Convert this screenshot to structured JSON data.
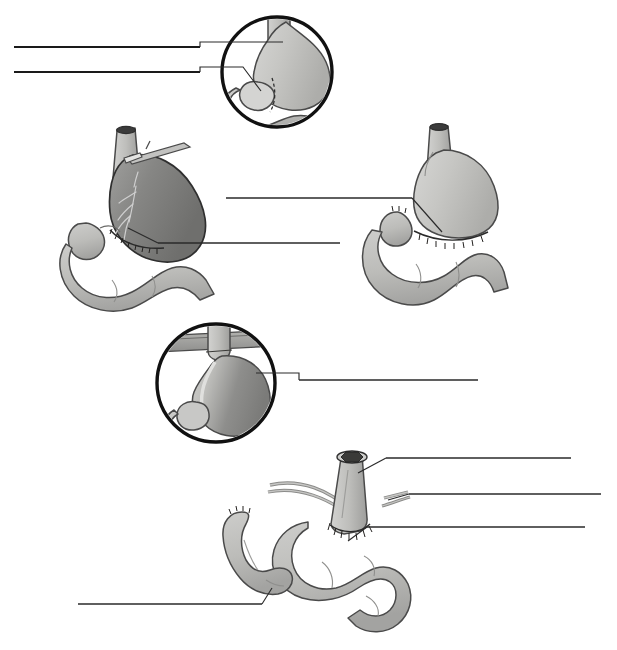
{
  "document": {
    "title": "Gastrectomy and Reconstruction Plate",
    "subject": "Total / subtotal gastrectomy with Billroth II and Roux-en-Y esophagojejunostomy reconstruction",
    "background_color": "#ffffff",
    "width": 617,
    "height": 650,
    "labels_present": false,
    "note": "All leader lines terminate in blank label areas; no label text is rendered in the image."
  },
  "palette": {
    "page_background": "#ffffff",
    "leader_line_dark": "#1a1a1a",
    "leader_line_thin": "#2a2a2a",
    "inset_ring": "#111111",
    "organ_fill_light": "#c9c9c7",
    "organ_fill_mid": "#b9b9b6",
    "organ_fill_shadow": "#a2a2a0",
    "organ_fill_dark": "#8a8a88",
    "organ_fill_darker": "#777775",
    "organ_outline": "#4a4a4a",
    "organ_outline_dark": "#2f2f2f",
    "lumen_dark": "#3b3b3b",
    "vessel_highlight": "#cfcfcf",
    "suture_stroke": "#23211f",
    "instrument_fill": "#bdbdbb"
  },
  "panels": [
    {
      "id": "panel-a",
      "name": "inset-stomach-resection-margins",
      "type": "circular-inset",
      "position": "top-center",
      "center": {
        "x": 277,
        "y": 72
      },
      "radius": 55,
      "description": "Circular magnified inset showing the stomach with esophagus above, duodenal bulb and proximal duodenum below, and a dashed resection line across the antrum.",
      "leader_lines": 2
    },
    {
      "id": "panel-b",
      "name": "stomach-with-clamp-and-vasculature",
      "type": "organ-figure",
      "position": "middle-left",
      "description": "Resected stomach specimen held by a surgical clamp on the proximal cardia, showing gastric vasculature, a sutured distal transection margin, and attached duodenum and jejunal loop.",
      "leader_lines": 1
    },
    {
      "id": "panel-c",
      "name": "billroth-two-gastrojejunostomy",
      "type": "organ-figure",
      "position": "middle-right",
      "description": "Completed gastrojejunal anastomosis: gastric remnant sutured to a jejunal loop with a blind afferent limb; esophagus stump above.",
      "leader_lines": 1
    },
    {
      "id": "panel-d",
      "name": "inset-stomach-through-diaphragm",
      "type": "circular-inset",
      "position": "lower-center-left",
      "center": {
        "x": 216,
        "y": 383
      },
      "radius": 59,
      "description": "Circular magnified inset showing the stomach passing through the diaphragmatic hiatus, with dark shading of the gastric body and lighter lesser-curvature highlight.",
      "leader_lines": 1
    },
    {
      "id": "panel-e",
      "name": "roux-en-y-esophagojejunostomy",
      "type": "organ-figure",
      "position": "bottom-right",
      "description": "Roux-en-Y reconstruction after total gastrectomy: transected esophagus with visible dark lumen anastomosed end-to-side to the jejunal Roux limb, with mesenteric vessels crossing and a blind-ended afferent limb to the left.",
      "leader_lines": 4
    }
  ],
  "leader_lines": [
    {
      "id": "leader-1",
      "name": "leader-line-panel-a-esophagus",
      "panel": "panel-a",
      "target": "esophagus",
      "label_text": "",
      "label_side": "left",
      "label_rule": {
        "x1": 14,
        "y1": 47,
        "x2": 200,
        "y2": 47
      },
      "pointer": [
        [
          200,
          47
        ],
        [
          200,
          42
        ],
        [
          283,
          42
        ]
      ]
    },
    {
      "id": "leader-2",
      "name": "leader-line-panel-a-pylorus",
      "panel": "panel-a",
      "target": "pyloric-antrum",
      "label_text": "",
      "label_side": "left",
      "label_rule": {
        "x1": 14,
        "y1": 72,
        "x2": 200,
        "y2": 72
      },
      "pointer": [
        [
          200,
          72
        ],
        [
          200,
          67
        ],
        [
          243,
          67
        ],
        [
          261,
          91
        ]
      ]
    },
    {
      "id": "leader-3",
      "name": "leader-line-panel-c-gastrojejunal-anastomosis",
      "panel": "panel-c",
      "target": "gastrojejunostomy-suture-line",
      "label_text": "",
      "label_side": "left",
      "label_rule": {
        "x1": 226,
        "y1": 198,
        "x2": 412,
        "y2": 198
      },
      "pointer": [
        [
          412,
          198
        ],
        [
          442,
          232
        ]
      ]
    },
    {
      "id": "leader-4",
      "name": "leader-line-panel-b-duodenal-stump",
      "panel": "panel-b",
      "target": "distal-transection-suture-line",
      "label_text": "",
      "label_side": "right",
      "label_rule": {
        "x1": 340,
        "y1": 243,
        "x2": 158,
        "y2": 243
      },
      "pointer": [
        [
          158,
          243
        ],
        [
          128,
          228
        ]
      ]
    },
    {
      "id": "leader-5",
      "name": "leader-line-panel-d-gastric-body",
      "panel": "panel-d",
      "target": "gastric-body",
      "label_text": "",
      "label_side": "right",
      "label_rule": {
        "x1": 478,
        "y1": 380,
        "x2": 299,
        "y2": 380
      },
      "pointer": [
        [
          299,
          380
        ],
        [
          299,
          373
        ],
        [
          256,
          373
        ]
      ]
    },
    {
      "id": "leader-6",
      "name": "leader-line-panel-e-esophagus",
      "panel": "panel-e",
      "target": "transected-esophagus",
      "label_text": "",
      "label_side": "right",
      "label_rule": {
        "x1": 571,
        "y1": 458,
        "x2": 386,
        "y2": 458
      },
      "pointer": [
        [
          386,
          458
        ],
        [
          358,
          473
        ]
      ]
    },
    {
      "id": "leader-7",
      "name": "leader-line-panel-e-mesenteric-vessels",
      "panel": "panel-e",
      "target": "mesenteric-vessels",
      "label_text": "",
      "label_side": "right",
      "label_rule": {
        "x1": 601,
        "y1": 494,
        "x2": 409,
        "y2": 494
      },
      "pointer": [
        [
          409,
          494
        ],
        [
          388,
          500
        ]
      ]
    },
    {
      "id": "leader-8",
      "name": "leader-line-panel-e-roux-limb-anastomosis",
      "panel": "panel-e",
      "target": "esophagojejunal-anastomosis",
      "label_text": "",
      "label_side": "right",
      "label_rule": {
        "x1": 585,
        "y1": 527,
        "x2": 367,
        "y2": 527
      },
      "pointer": [
        [
          367,
          527
        ],
        [
          348,
          541
        ]
      ]
    },
    {
      "id": "leader-9",
      "name": "leader-line-panel-e-afferent-limb",
      "panel": "panel-e",
      "target": "blind-afferent-jejunal-limb",
      "label_text": "",
      "label_side": "left",
      "label_rule": {
        "x1": 78,
        "y1": 604,
        "x2": 262,
        "y2": 604
      },
      "pointer": [
        [
          262,
          604
        ],
        [
          272,
          588
        ]
      ]
    }
  ]
}
